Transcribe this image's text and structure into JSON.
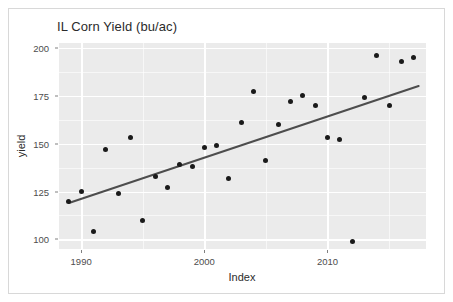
{
  "chart_data": {
    "type": "scatter",
    "title": "IL Corn Yield (bu/ac)",
    "xlabel": "Index",
    "ylabel": "yield",
    "xlim": [
      1988.2,
      2018.0
    ],
    "ylim": [
      95.0,
      202.5
    ],
    "xticks": [
      1990,
      2000,
      2010
    ],
    "yticks": [
      100,
      125,
      150,
      175,
      200
    ],
    "grid": true,
    "legend": false,
    "legend_position": "none",
    "x": [
      1989,
      1990,
      1991,
      1992,
      1993,
      1994,
      1995,
      1996,
      1997,
      1998,
      1999,
      2000,
      2001,
      2002,
      2003,
      2004,
      2005,
      2006,
      2007,
      2008,
      2009,
      2010,
      2011,
      2012,
      2013,
      2014,
      2015,
      2016,
      2017
    ],
    "values": [
      120,
      125,
      104,
      147,
      124,
      153,
      110,
      133,
      127,
      139,
      138,
      148,
      149,
      132,
      161,
      177,
      141,
      160,
      172,
      175,
      170,
      153,
      152,
      99,
      174,
      196,
      170,
      193,
      195
    ],
    "series": [
      {
        "name": "yield",
        "type": "scatter",
        "marker": "filled-circle",
        "color": "#1a1a1a",
        "values": [
          120,
          125,
          104,
          147,
          124,
          153,
          110,
          133,
          127,
          139,
          138,
          148,
          149,
          132,
          161,
          177,
          141,
          160,
          172,
          175,
          170,
          153,
          152,
          99,
          174,
          196,
          170,
          193,
          195
        ]
      },
      {
        "name": "linear trend",
        "type": "line",
        "color": "#4d4d4d",
        "endpoints": [
          {
            "x": 1989.0,
            "y": 119.0
          },
          {
            "x": 2017.4,
            "y": 180.0
          }
        ]
      }
    ],
    "panel_background": "#ebebeb",
    "gridline_color": "#ffffff",
    "point_color": "#1a1a1a",
    "trend_color": "#4d4d4d"
  }
}
